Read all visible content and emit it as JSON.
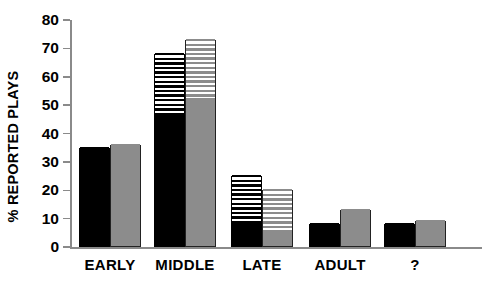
{
  "chart_data": {
    "type": "bar",
    "title": "",
    "subtitle": "",
    "xlabel": "",
    "ylabel": "% REPORTED PLAYS",
    "ylim": [
      0,
      80
    ],
    "yticks": [
      0,
      10,
      20,
      30,
      40,
      50,
      60,
      70,
      80
    ],
    "ytick_labels": [
      "0",
      "10",
      "20",
      "30",
      "40",
      "50",
      "60",
      "70",
      "80"
    ],
    "grid": false,
    "legend": null,
    "categories": [
      "EARLY",
      "MIDDLE",
      "LATE",
      "ADULT",
      "?"
    ],
    "stacked": true,
    "series": [
      {
        "name": "black",
        "color": "#000000",
        "solid_values": [
          35,
          46,
          8,
          8,
          8
        ],
        "total_values": [
          35,
          68,
          25,
          8,
          8
        ],
        "hatched_values": [
          0,
          22,
          17,
          0,
          0
        ]
      },
      {
        "name": "gray",
        "color": "#8c8c8c",
        "solid_values": [
          36,
          52,
          5,
          13,
          9
        ],
        "total_values": [
          36,
          73,
          20,
          13,
          9
        ],
        "hatched_values": [
          0,
          21,
          15,
          0,
          0
        ]
      }
    ],
    "annotations": []
  },
  "axis": {
    "y_title": "% REPORTED PLAYS",
    "tick_labels": [
      "80",
      "70",
      "60",
      "50",
      "40",
      "30",
      "20",
      "10",
      "0"
    ]
  },
  "x_labels": [
    "EARLY",
    "MIDDLE",
    "LATE",
    "ADULT",
    "?"
  ]
}
